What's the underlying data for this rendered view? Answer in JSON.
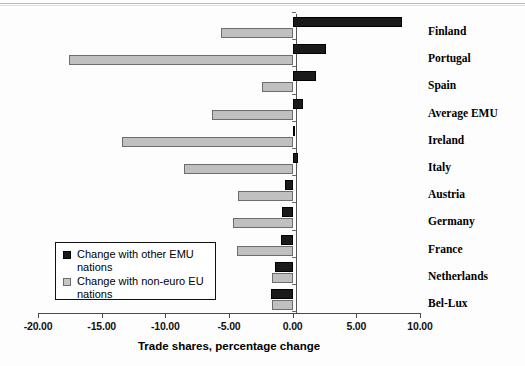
{
  "chart_data": {
    "type": "bar",
    "orientation": "horizontal",
    "title": "",
    "xlabel": "Trade shares, percentage change",
    "ylabel": "",
    "xlim": [
      -20.0,
      10.0
    ],
    "xticks": [
      "-20.00",
      "-15.00",
      "-10.00",
      "-5.00",
      "0.00",
      "5.00",
      "10.00"
    ],
    "xtick_values": [
      -20,
      -15,
      -10,
      -5,
      0,
      5,
      10
    ],
    "grid": false,
    "legend_position": "inner-lower-left",
    "categories": [
      "Finland",
      "Portugal",
      "Spain",
      "Average EMU",
      "Ireland",
      "Italy",
      "Austria",
      "Germany",
      "France",
      "Netherlands",
      "Bel-Lux"
    ],
    "series": [
      {
        "name": "Change with other EMU nations",
        "color": "#1a1a1a",
        "values": [
          8.6,
          2.6,
          1.8,
          0.8,
          0.05,
          0.4,
          -0.6,
          -0.8,
          -0.9,
          -1.4,
          -1.7
        ]
      },
      {
        "name": "Change with non-euro EU nations",
        "color": "#c0c0c0",
        "values": [
          -5.6,
          -17.6,
          -2.4,
          -6.3,
          -13.4,
          -8.5,
          -4.3,
          -4.65,
          -4.4,
          -1.6,
          -1.6
        ]
      }
    ]
  },
  "legend": {
    "entries": [
      {
        "label": "Change with other EMU nations",
        "swatch": "black-square"
      },
      {
        "label": "Change with non-euro EU nations",
        "swatch": "gray-square"
      }
    ]
  }
}
